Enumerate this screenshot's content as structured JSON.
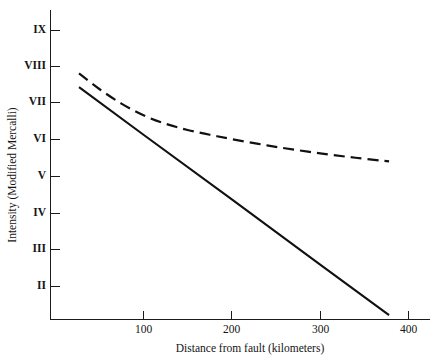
{
  "chart_data": {
    "type": "line",
    "title": "",
    "xlabel": "Distance from fault (kilometers)",
    "ylabel": "Intensity (Modified Mercalli)",
    "xlim": [
      0,
      430
    ],
    "ylim": [
      1.2,
      9.6
    ],
    "grid": false,
    "legend": "none",
    "x_ticks": [
      100,
      200,
      300,
      400
    ],
    "x_tick_labels": [
      "100",
      "200",
      "300",
      "400"
    ],
    "y_ticks": [
      2,
      3,
      4,
      5,
      6,
      7,
      8,
      9
    ],
    "y_tick_labels": [
      "II",
      "III",
      "IV",
      "V",
      "VI",
      "VII",
      "VIII",
      "IX"
    ],
    "series": [
      {
        "name": "soft-soil-attenuation",
        "style": "dashed",
        "color": "#111111",
        "x": [
          27,
          50,
          75,
          100,
          125,
          150,
          175,
          200,
          230,
          260,
          300,
          340,
          378
        ],
        "y": [
          7.83,
          7.4,
          7.0,
          6.68,
          6.45,
          6.28,
          6.15,
          6.03,
          5.9,
          5.78,
          5.64,
          5.52,
          5.42
        ]
      },
      {
        "name": "firm-rock-attenuation",
        "style": "solid",
        "color": "#111111",
        "x": [
          27,
          100,
          200,
          300,
          378
        ],
        "y": [
          7.45,
          6.15,
          4.38,
          2.6,
          1.22
        ]
      }
    ]
  },
  "axes": {
    "x_axis_name": "x-axis",
    "y_axis_name": "y-axis"
  }
}
